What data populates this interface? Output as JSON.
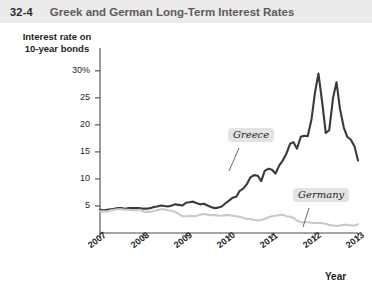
{
  "header": {
    "figure_number": "32-4",
    "title": "Greek and German Long-Term Interest Rates"
  },
  "chart_data": {
    "type": "line",
    "title": "Greek and German Long-Term Interest Rates",
    "xlabel": "Year",
    "ylabel": "Interest rate on 10-year bonds",
    "ylabel_lines": [
      "Interest rate on",
      "10-year bonds"
    ],
    "xlim": [
      2007,
      2013
    ],
    "ylim": [
      0,
      32
    ],
    "grid": false,
    "legend_position": "inline-callout",
    "y_ticks": [
      {
        "value": 30,
        "label": "30%"
      },
      {
        "value": 25,
        "label": "25"
      },
      {
        "value": 20,
        "label": "20"
      },
      {
        "value": 15,
        "label": "15"
      },
      {
        "value": 10,
        "label": "10"
      },
      {
        "value": 5,
        "label": "5"
      }
    ],
    "x_ticks": [
      {
        "value": 2007,
        "label": "2007"
      },
      {
        "value": 2008,
        "label": "2008"
      },
      {
        "value": 2009,
        "label": "2009"
      },
      {
        "value": 2010,
        "label": "2010"
      },
      {
        "value": 2011,
        "label": "2011"
      },
      {
        "value": 2012,
        "label": "2012"
      },
      {
        "value": 2013,
        "label": "2013"
      }
    ],
    "series": [
      {
        "name": "Greece",
        "label": "Greece",
        "color": "#3a3a3a",
        "width": 2.1,
        "x": [
          2007.0,
          2007.08,
          2007.17,
          2007.25,
          2007.33,
          2007.42,
          2007.5,
          2007.58,
          2007.67,
          2007.75,
          2007.83,
          2007.92,
          2008.0,
          2008.08,
          2008.17,
          2008.25,
          2008.33,
          2008.42,
          2008.5,
          2008.58,
          2008.67,
          2008.75,
          2008.83,
          2008.92,
          2009.0,
          2009.08,
          2009.17,
          2009.25,
          2009.33,
          2009.42,
          2009.5,
          2009.58,
          2009.67,
          2009.75,
          2009.83,
          2009.92,
          2010.0,
          2010.08,
          2010.17,
          2010.25,
          2010.33,
          2010.42,
          2010.5,
          2010.58,
          2010.67,
          2010.75,
          2010.83,
          2010.92,
          2011.0,
          2011.08,
          2011.17,
          2011.25,
          2011.33,
          2011.42,
          2011.5,
          2011.58,
          2011.67,
          2011.75,
          2011.83,
          2011.92,
          2012.0,
          2012.08,
          2012.17,
          2012.25,
          2012.33,
          2012.42,
          2012.5,
          2012.58,
          2012.67,
          2012.75,
          2012.83,
          2012.92,
          2013.0
        ],
        "y": [
          4.3,
          4.2,
          4.3,
          4.4,
          4.5,
          4.6,
          4.6,
          4.5,
          4.6,
          4.6,
          4.6,
          4.6,
          4.5,
          4.5,
          4.6,
          4.8,
          4.9,
          5.1,
          5.0,
          4.9,
          5.1,
          5.3,
          5.2,
          5.1,
          5.6,
          5.7,
          5.8,
          5.5,
          5.3,
          5.4,
          5.1,
          4.8,
          4.6,
          4.7,
          4.9,
          5.5,
          6.0,
          6.5,
          6.7,
          7.8,
          8.2,
          9.1,
          10.3,
          10.7,
          10.6,
          9.6,
          11.5,
          11.9,
          11.7,
          11.0,
          12.5,
          13.4,
          14.6,
          16.5,
          16.8,
          15.6,
          17.8,
          18.0,
          17.9,
          21.1,
          26.0,
          29.5,
          24.0,
          18.5,
          19.0,
          25.0,
          27.9,
          23.0,
          19.5,
          17.8,
          17.3,
          16.0,
          13.4
        ]
      },
      {
        "name": "Germany",
        "label": "Germany",
        "color": "#c9c9c9",
        "width": 2.1,
        "x": [
          2007.0,
          2007.08,
          2007.17,
          2007.25,
          2007.33,
          2007.42,
          2007.5,
          2007.58,
          2007.67,
          2007.75,
          2007.83,
          2007.92,
          2008.0,
          2008.08,
          2008.17,
          2008.25,
          2008.33,
          2008.42,
          2008.5,
          2008.58,
          2008.67,
          2008.75,
          2008.83,
          2008.92,
          2009.0,
          2009.08,
          2009.17,
          2009.25,
          2009.33,
          2009.42,
          2009.5,
          2009.58,
          2009.67,
          2009.75,
          2009.83,
          2009.92,
          2010.0,
          2010.08,
          2010.17,
          2010.25,
          2010.33,
          2010.42,
          2010.5,
          2010.58,
          2010.67,
          2010.75,
          2010.83,
          2010.92,
          2011.0,
          2011.08,
          2011.17,
          2011.25,
          2011.33,
          2011.42,
          2011.5,
          2011.58,
          2011.67,
          2011.75,
          2011.83,
          2011.92,
          2012.0,
          2012.08,
          2012.17,
          2012.25,
          2012.33,
          2012.42,
          2012.5,
          2012.58,
          2012.67,
          2012.75,
          2012.83,
          2012.92,
          2013.0
        ],
        "y": [
          4.0,
          4.0,
          4.0,
          4.2,
          4.3,
          4.4,
          4.4,
          4.3,
          4.3,
          4.2,
          4.2,
          4.3,
          4.0,
          3.9,
          3.9,
          4.1,
          4.2,
          4.4,
          4.4,
          4.2,
          4.1,
          3.9,
          3.5,
          3.1,
          3.1,
          3.2,
          3.1,
          3.2,
          3.4,
          3.5,
          3.4,
          3.3,
          3.3,
          3.2,
          3.2,
          3.3,
          3.3,
          3.2,
          3.1,
          3.0,
          2.8,
          2.6,
          2.6,
          2.4,
          2.3,
          2.4,
          2.6,
          2.9,
          3.1,
          3.2,
          3.3,
          3.4,
          3.1,
          3.0,
          2.8,
          2.3,
          2.0,
          2.0,
          2.0,
          1.9,
          1.8,
          1.9,
          1.8,
          1.7,
          1.5,
          1.4,
          1.3,
          1.4,
          1.5,
          1.5,
          1.4,
          1.4,
          1.6
        ]
      }
    ]
  },
  "annotations": {
    "greece_badge": "Greece",
    "germany_badge": "Germany"
  }
}
